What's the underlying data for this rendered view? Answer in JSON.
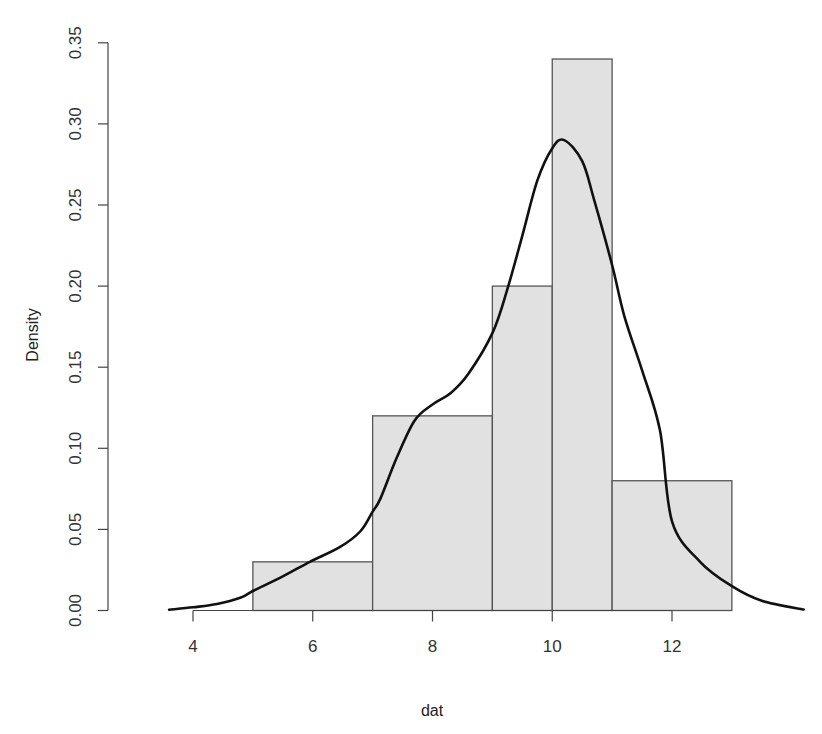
{
  "chart_data": {
    "type": "bar",
    "subtype": "histogram-with-density",
    "title": "",
    "xlabel": "dat",
    "ylabel": "Density",
    "xlim": [
      3.6,
      14.2
    ],
    "ylim": [
      0,
      0.35
    ],
    "grid": false,
    "x_ticks": [
      4,
      6,
      8,
      10,
      12
    ],
    "x_tick_labels": [
      "4",
      "6",
      "8",
      "10",
      "12"
    ],
    "y_ticks": [
      0.0,
      0.05,
      0.1,
      0.15,
      0.2,
      0.25,
      0.3,
      0.35
    ],
    "y_tick_labels": [
      "0.00",
      "0.05",
      "0.10",
      "0.15",
      "0.20",
      "0.25",
      "0.30",
      "0.35"
    ],
    "bins": [
      {
        "start": 5,
        "end": 7,
        "density": 0.03
      },
      {
        "start": 7,
        "end": 9,
        "density": 0.12
      },
      {
        "start": 9,
        "end": 10,
        "density": 0.2
      },
      {
        "start": 10,
        "end": 11,
        "density": 0.34
      },
      {
        "start": 11,
        "end": 13,
        "density": 0.08
      }
    ],
    "series": [
      {
        "name": "density",
        "type": "line",
        "x": [
          3.6,
          4.0,
          4.4,
          4.8,
          5.0,
          5.5,
          5.95,
          6.45,
          6.8,
          7.0,
          7.13,
          7.4,
          7.7,
          8.0,
          8.3,
          8.6,
          9.0,
          9.25,
          9.5,
          9.75,
          10.0,
          10.2,
          10.5,
          10.7,
          11.0,
          11.2,
          11.5,
          11.8,
          12.0,
          12.47,
          13.0,
          13.5,
          14.2
        ],
        "y": [
          0.0005,
          0.002,
          0.004,
          0.008,
          0.012,
          0.021,
          0.03,
          0.039,
          0.049,
          0.061,
          0.069,
          0.094,
          0.117,
          0.127,
          0.134,
          0.146,
          0.171,
          0.198,
          0.231,
          0.265,
          0.285,
          0.29,
          0.277,
          0.253,
          0.213,
          0.182,
          0.148,
          0.111,
          0.055,
          0.03,
          0.015,
          0.006,
          0.0006
        ]
      }
    ]
  }
}
